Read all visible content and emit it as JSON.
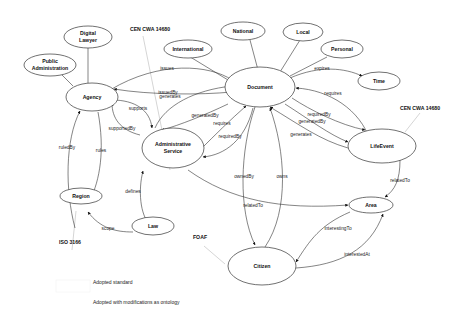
{
  "nodes": {
    "digital_lawyer": {
      "line1": "Digital",
      "line2": "Lawyer"
    },
    "public_admin": {
      "line1": "Public",
      "line2": "Administration"
    },
    "agency": {
      "label": "Agency"
    },
    "international": {
      "label": "International"
    },
    "national": {
      "label": "National"
    },
    "local": {
      "label": "Local"
    },
    "personal": {
      "label": "Personal"
    },
    "time": {
      "label": "Time"
    },
    "document": {
      "label": "Document"
    },
    "admin_service": {
      "line1": "Administrative",
      "line2": "Service"
    },
    "life_event": {
      "label": "LifeEvent"
    },
    "region": {
      "label": "Region"
    },
    "law": {
      "label": "Law"
    },
    "area": {
      "label": "Area"
    },
    "citizen": {
      "label": "Citizen"
    }
  },
  "standards": {
    "cen_left": "CEN CWA 14680",
    "cen_right": "CEN CWA 14680",
    "iso": "ISO 3166",
    "foaf": "FOAF"
  },
  "edges": {
    "issues": "issues",
    "issuedBy": "issuedBy",
    "generates_top": "generates",
    "supports": "supports",
    "supportedBy": "supportedBy",
    "generatedBy_left": "generatedBy",
    "requires_left": "requires",
    "requiredBy_left": "requiredBy",
    "expires": "expires",
    "requires_right": "requires",
    "requiredBy_right": "requiredBy",
    "generatedBy_right": "generatedBy",
    "generates_right": "generates",
    "ownedBy": "ownedBy",
    "owns": "owns",
    "relatedTo_area": "relatedTo",
    "relatedTo_life": "relatedTo",
    "interestingTo": "interestingTo",
    "interestedAt": "interestedAt",
    "ruledBy": "ruledBy",
    "rules": "rules",
    "defines": "defines",
    "scope": "scope"
  },
  "legend": {
    "adopted_standard": "Adopted standard",
    "adopted_modified": "Adopted with modifications as ontology"
  }
}
